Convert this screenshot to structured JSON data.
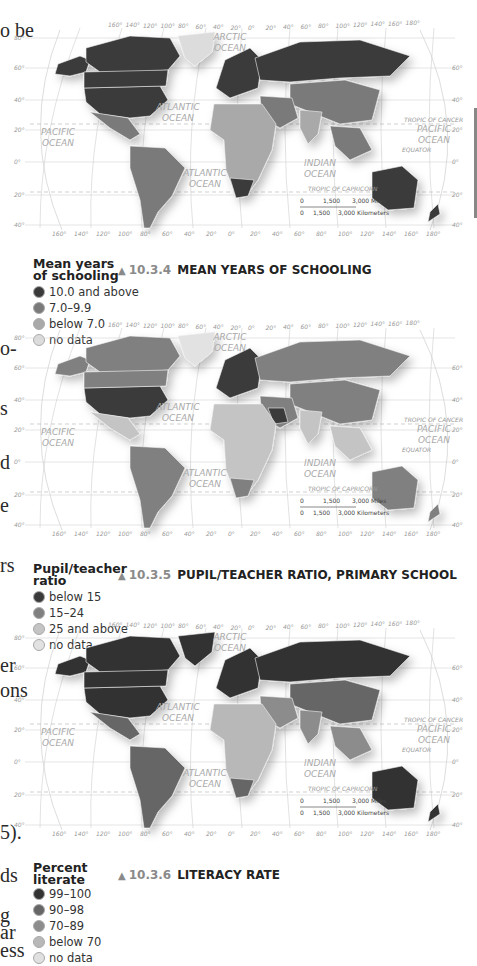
{
  "page_text_fragments": [
    {
      "text": "o be",
      "top": 20
    },
    {
      "text": "o-",
      "top": 338
    },
    {
      "text": "s",
      "top": 398
    },
    {
      "text": "d",
      "top": 452
    },
    {
      "text": "e",
      "top": 495
    },
    {
      "text": "rs",
      "top": 555
    },
    {
      "text": "er",
      "top": 655
    },
    {
      "text": "ons",
      "top": 680
    },
    {
      "text": "5).",
      "top": 822
    },
    {
      "text": "ds",
      "top": 865
    },
    {
      "text": "g",
      "top": 905
    },
    {
      "text": "ar",
      "top": 922
    },
    {
      "text": "ess",
      "top": 940
    }
  ],
  "map_labels": {
    "longitude_top": [
      "160°",
      "140°",
      "120°",
      "100°",
      "80°",
      "60°",
      "40°",
      "20°",
      "0°",
      "20°",
      "40°",
      "60°",
      "80°",
      "100°",
      "120°",
      "140°",
      "160°",
      "180°"
    ],
    "longitude_bottom": [
      "160°",
      "140°",
      "120°",
      "100°",
      "80°",
      "60°",
      "40°",
      "20°",
      "0°",
      "20°",
      "40°",
      "60°",
      "80°",
      "100°",
      "120°",
      "140°",
      "160°",
      "180°"
    ],
    "latitude": [
      "80°",
      "60°",
      "40°",
      "20°",
      "0°",
      "20°",
      "40°"
    ],
    "oceans": {
      "arctic": "ARCTIC OCEAN",
      "atlantic_north": "ATLANTIC OCEAN",
      "atlantic_south": "ATLANTIC OCEAN",
      "pacific_west": "PACIFIC OCEAN",
      "pacific_east": "PACIFIC OCEAN",
      "indian": "INDIAN OCEAN"
    },
    "tropic_cancer": "TROPIC OF CANCER",
    "tropic_capricorn": "TROPIC OF CAPRICORN",
    "equator": "EQUATOR",
    "scale_miles": [
      "0",
      "1,500",
      "3,000 Miles"
    ],
    "scale_km": [
      "0",
      "1,500",
      "3,000 Kilometers"
    ]
  },
  "maps": [
    {
      "id": "10.3.4",
      "title": "MEAN YEARS OF SCHOOLING",
      "legend_title_1": "Mean years",
      "legend_title_2": "of schooling",
      "legend": [
        {
          "label": "10.0 and above",
          "color": "#3a3a3a"
        },
        {
          "label": "7.0–9.9",
          "color": "#7a7a7a"
        },
        {
          "label": "below 7.0",
          "color": "#a9a9a9"
        },
        {
          "label": "no data",
          "color": "#dcdcdc"
        }
      ]
    },
    {
      "id": "10.3.5",
      "title": "PUPIL/TEACHER RATIO, PRIMARY SCHOOL",
      "legend_title_1": "Pupil/teacher",
      "legend_title_2": "ratio",
      "legend": [
        {
          "label": "below 15",
          "color": "#3a3a3a"
        },
        {
          "label": "15–24",
          "color": "#808080"
        },
        {
          "label": "25 and above",
          "color": "#c4c4c4"
        },
        {
          "label": "no data",
          "color": "#e2e2e2"
        }
      ]
    },
    {
      "id": "10.3.6",
      "title": "LITERACY RATE",
      "legend_title_1": "Percent",
      "legend_title_2": "literate",
      "legend": [
        {
          "label": "99–100",
          "color": "#333333"
        },
        {
          "label": "90–98",
          "color": "#666666"
        },
        {
          "label": "70–89",
          "color": "#8c8c8c"
        },
        {
          "label": "below 70",
          "color": "#b8b8b8"
        },
        {
          "label": "no data",
          "color": "#e0e0e0"
        }
      ]
    }
  ]
}
